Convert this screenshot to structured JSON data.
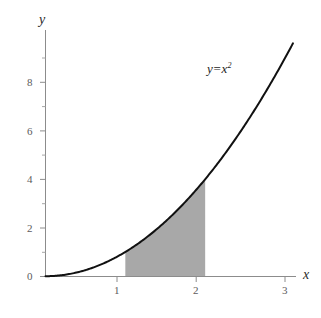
{
  "chart_data": {
    "type": "line",
    "title": "",
    "xlabel": "x",
    "ylabel": "y",
    "curve_label": {
      "lhs": "y",
      "operator": "=",
      "base": "x",
      "exponent": "2",
      "full": "y = x²"
    },
    "function": "y = x^2",
    "xlim": [
      0,
      3.1
    ],
    "ylim": [
      0,
      9.8
    ],
    "grid": false,
    "legend_position": "none",
    "x_ticks_major": [
      1,
      2,
      3
    ],
    "x_tick_labels": [
      "1",
      "2",
      "3"
    ],
    "y_ticks_major": [
      0,
      2,
      4,
      6,
      8
    ],
    "y_tick_labels": [
      "0",
      "2",
      "4",
      "6",
      "8"
    ],
    "y_ticks_minor": [
      1,
      3,
      5,
      7,
      9
    ],
    "x": [
      0,
      0.25,
      0.5,
      0.75,
      1,
      1.25,
      1.5,
      1.75,
      2,
      2.25,
      2.5,
      2.75,
      3,
      3.1
    ],
    "y": [
      0,
      0.0625,
      0.25,
      0.5625,
      1,
      1.5625,
      2.25,
      3.0625,
      4,
      5.0625,
      6.25,
      7.5625,
      9,
      9.61
    ],
    "shaded_region": {
      "label": "area under y = x² from x=1 to x=2",
      "x_start": 1,
      "x_end": 2,
      "y_start": 0,
      "color": "#a8a8a8"
    },
    "colors": {
      "curve": "#111111",
      "axis": "#8c8c8c",
      "tick_label": "#5c5c5c",
      "shade": "#a8a8a8",
      "background": "#ffffff"
    }
  },
  "axis": {
    "x_name": "x",
    "y_name": "y"
  },
  "x_tick_labels": [
    {
      "text": "1",
      "left": 114,
      "top": 285
    },
    {
      "text": "2",
      "left": 193,
      "top": 285
    },
    {
      "text": "3",
      "left": 282,
      "top": 285
    }
  ],
  "y_tick_labels": [
    {
      "text": "0",
      "left": 27,
      "top": 271
    },
    {
      "text": "2",
      "left": 27,
      "top": 223
    },
    {
      "text": "4",
      "left": 27,
      "top": 174
    },
    {
      "text": "6",
      "left": 27,
      "top": 126
    },
    {
      "text": "8",
      "left": 27,
      "top": 77
    }
  ]
}
